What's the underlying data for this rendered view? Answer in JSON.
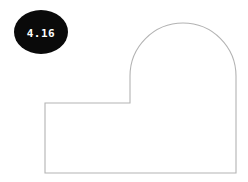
{
  "figure": {
    "background_color": "#ffffff",
    "width": 248,
    "height": 182,
    "shape": {
      "name": "arched-block-outline",
      "fill_color": "#ffffff",
      "stroke_color": "#b3b3b3",
      "stroke_width": 1.1,
      "path": "M 45 103 L 130 103 L 130 76 A 53 53 0 0 1 236 76 L 236 173 L 45 173 Z",
      "vertices": [
        {
          "label": "rect-top-left",
          "x": 45,
          "y": 103
        },
        {
          "label": "notch-corner",
          "x": 130,
          "y": 103
        },
        {
          "label": "arch-spring-left",
          "x": 130,
          "y": 76
        },
        {
          "label": "arch-apex",
          "x": 183,
          "y": 23
        },
        {
          "label": "arch-spring-right",
          "x": 236,
          "y": 76
        },
        {
          "label": "rect-bottom-right",
          "x": 236,
          "y": 173
        },
        {
          "label": "rect-bottom-left",
          "x": 45,
          "y": 173
        }
      ],
      "arc": {
        "center_x": 183,
        "center_y": 76,
        "radius": 53,
        "sweep": "semicircle"
      }
    },
    "badge": {
      "name": "value-badge",
      "value": "4.16",
      "text_color": "#ffffff",
      "fill_color": "#0a0a0a",
      "center_x": 41,
      "center_y": 32,
      "radius_x": 27,
      "radius_y": 22
    }
  }
}
